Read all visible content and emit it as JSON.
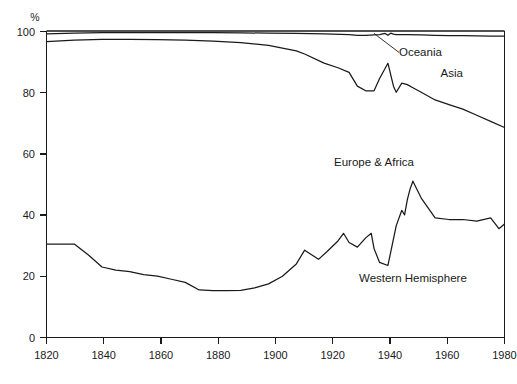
{
  "chart_data": {
    "type": "line",
    "title": "",
    "subtitle": "",
    "xlabel": "",
    "ylabel": "",
    "y_unit": "%",
    "xlim": [
      1820,
      1985
    ],
    "ylim": [
      0,
      100
    ],
    "grid": false,
    "legend_position": "inline-annotations",
    "x_ticks": [
      1820,
      1840,
      1860,
      1880,
      1900,
      1920,
      1940,
      1960,
      1980
    ],
    "x_tick_labels": [
      "1820",
      "1840",
      "1860",
      "1880",
      "1900",
      "1920",
      "1940",
      "1960",
      "1980"
    ],
    "y_ticks": [
      0,
      20,
      40,
      60,
      80,
      100
    ],
    "y_tick_labels": [
      "0",
      "20",
      "40",
      "60",
      "80",
      "100"
    ],
    "series": [
      {
        "name": "Western Hemisphere",
        "label": "Western Hemisphere",
        "label_x": 1952,
        "label_y": 18,
        "boundary": "cumulative lower band top",
        "x": [
          1820,
          1825,
          1830,
          1835,
          1840,
          1845,
          1850,
          1855,
          1860,
          1865,
          1870,
          1875,
          1880,
          1885,
          1890,
          1895,
          1900,
          1905,
          1910,
          1913,
          1918,
          1921,
          1925,
          1927,
          1929,
          1932,
          1935,
          1937,
          1938,
          1940,
          1943,
          1946,
          1948,
          1949,
          1950,
          1951,
          1952,
          1955,
          1960,
          1965,
          1970,
          1975,
          1980,
          1983,
          1985
        ],
        "values": [
          30.5,
          30.5,
          30.5,
          27.0,
          23.0,
          22.0,
          21.5,
          20.5,
          20.0,
          19.0,
          18.0,
          15.5,
          15.3,
          15.3,
          15.4,
          16.2,
          17.5,
          20.0,
          24.0,
          28.5,
          25.5,
          28.0,
          31.5,
          34.0,
          31.0,
          29.5,
          32.5,
          34.0,
          29.0,
          24.5,
          23.5,
          36.5,
          41.5,
          40.0,
          45.0,
          48.5,
          51.0,
          45.5,
          39.0,
          38.5,
          38.5,
          38.0,
          39.0,
          35.5,
          37.0
        ]
      },
      {
        "name": "Europe & Africa",
        "label": "Europe & Africa",
        "label_x": 1938,
        "label_y": 56,
        "boundary": "cumulative Western Hemisphere + Europe & Africa",
        "x": [
          1820,
          1830,
          1840,
          1850,
          1860,
          1870,
          1880,
          1890,
          1900,
          1910,
          1913,
          1920,
          1925,
          1929,
          1932,
          1935,
          1937,
          1938,
          1940,
          1943,
          1945,
          1946,
          1948,
          1950,
          1952,
          1955,
          1960,
          1965,
          1970,
          1975,
          1980,
          1985
        ],
        "values": [
          96.5,
          97.0,
          97.3,
          97.3,
          97.2,
          97.0,
          96.7,
          96.2,
          95.3,
          93.5,
          92.5,
          89.5,
          88.0,
          86.5,
          82.0,
          80.5,
          80.5,
          80.5,
          84.5,
          89.5,
          82.0,
          80.0,
          83.0,
          82.5,
          81.5,
          80.0,
          77.5,
          76.0,
          74.5,
          72.5,
          70.5,
          68.5
        ]
      },
      {
        "name": "Asia",
        "label": "Asia",
        "label_x": 1966,
        "label_y": 85,
        "boundary": "cumulative Western Hemisphere + Europe & Africa + Asia",
        "x": [
          1820,
          1830,
          1840,
          1850,
          1860,
          1870,
          1880,
          1890,
          1900,
          1910,
          1920,
          1929,
          1932,
          1935,
          1938,
          1940,
          1942,
          1943,
          1944,
          1945,
          1946,
          1950,
          1955,
          1960,
          1965,
          1970,
          1975,
          1980,
          1985
        ],
        "values": [
          99.1,
          99.3,
          99.5,
          99.5,
          99.5,
          99.5,
          99.5,
          99.4,
          99.3,
          99.2,
          99.1,
          98.8,
          98.6,
          98.6,
          98.7,
          98.8,
          99.2,
          98.6,
          99.3,
          99.0,
          98.8,
          98.8,
          98.7,
          98.6,
          98.5,
          98.5,
          98.4,
          98.3,
          98.3
        ]
      },
      {
        "name": "Oceania",
        "label": "Oceania",
        "label_x": 1947,
        "label_y": 92,
        "boundary": "100 percent top line",
        "x": [
          1820,
          1985
        ],
        "values": [
          100,
          100
        ]
      }
    ],
    "annotations": [
      {
        "text": "Oceania",
        "type": "leader-label",
        "leader_from_x": 1938,
        "leader_from_y": 99.2,
        "leader_to_x": 1947,
        "leader_to_y": 93
      }
    ]
  },
  "axes": {
    "y_unit_label": "%",
    "y_tick_labels": [
      "100",
      "80",
      "60",
      "40",
      "20",
      "0"
    ],
    "x_tick_labels": [
      "1820",
      "1840",
      "1860",
      "1880",
      "1900",
      "1920",
      "1940",
      "1960",
      "1980"
    ]
  },
  "labels": {
    "oceania": "Oceania",
    "asia": "Asia",
    "europe_africa": "Europe & Africa",
    "western_hemisphere": "Western Hemisphere"
  },
  "colors": {
    "ink": "#1a1a1a",
    "background": "#ffffff"
  }
}
